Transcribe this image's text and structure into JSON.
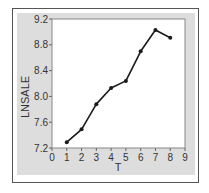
{
  "chart_data": {
    "type": "line",
    "title": "",
    "xlabel": "T",
    "ylabel": "LNSALE",
    "x": [
      1,
      2,
      3,
      4,
      5,
      6,
      7,
      8
    ],
    "series": [
      {
        "name": "LNSALE",
        "values": [
          7.29,
          7.49,
          7.88,
          8.13,
          8.24,
          8.7,
          9.03,
          8.91
        ]
      }
    ],
    "xlim": [
      0,
      9
    ],
    "ylim": [
      7.2,
      9.2
    ],
    "xticks": [
      0,
      1,
      2,
      3,
      4,
      5,
      6,
      7,
      8,
      9
    ],
    "yticks": [
      7.2,
      7.6,
      8.0,
      8.4,
      8.8,
      9.2
    ],
    "ytick_labels": [
      "7.2",
      "7.6",
      "8.0",
      "8.4",
      "8.8",
      "9.2"
    ],
    "xtick_labels": [
      "0",
      "1",
      "2",
      "3",
      "4",
      "5",
      "6",
      "7",
      "8",
      "9"
    ],
    "grid": false,
    "legend": "none",
    "markers": true
  },
  "colors": {
    "line": "#1a1a1a",
    "panel": "#dddddd",
    "plot_bg": "#ffffff",
    "frame": "#555555",
    "text": "#333333"
  }
}
